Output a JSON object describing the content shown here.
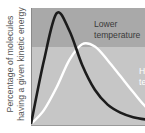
{
  "chart_data": {
    "type": "line",
    "title": "",
    "xlabel": "",
    "ylabel": "Percentage of molecules having a given kinetic energy",
    "ylabel_lines": [
      "Percentage of molecules",
      "having a given kinetic energy"
    ],
    "grid": false,
    "legend_position": "inline annotations",
    "x": [
      0,
      0.1,
      0.2,
      0.3,
      0.4,
      0.5,
      0.6,
      0.7,
      0.8,
      0.9,
      1.0
    ],
    "series": [
      {
        "name": "Lower temperature",
        "color": "#1c1c1c",
        "values": [
          0,
          0.55,
          0.97,
          0.82,
          0.52,
          0.3,
          0.17,
          0.1,
          0.06,
          0.04,
          0.03
        ]
      },
      {
        "name": "Higher temperature",
        "color": "#ffffff",
        "values": [
          0,
          0.12,
          0.32,
          0.56,
          0.7,
          0.68,
          0.56,
          0.42,
          0.28,
          0.15,
          0.08
        ]
      }
    ],
    "annotations": [
      {
        "text": "Lower\ntemperature",
        "series": "Lower temperature",
        "visible": "full"
      },
      {
        "text": "H\nte",
        "series": "Higher temperature",
        "visible": "cropped"
      }
    ],
    "background_bands": {
      "upper": "#a9a9a9",
      "lower": "#c6c6c6"
    },
    "axis_ranges": {
      "x": [
        0,
        1
      ],
      "y": [
        0,
        1
      ]
    }
  },
  "labels": {
    "ylabel_line1": "Percentage of molecules",
    "ylabel_line2": "having a given kinetic energy",
    "lower_line1": "Lower",
    "lower_line2": "temperature",
    "higher_line1": "H",
    "higher_line2": "te"
  }
}
